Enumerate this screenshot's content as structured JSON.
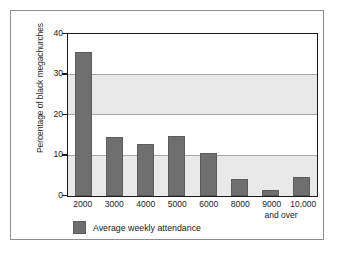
{
  "figure": {
    "border_color": "#8e8e8e",
    "background": "#ffffff"
  },
  "chart_data": {
    "type": "bar",
    "title": "",
    "xlabel": "",
    "ylabel": "Percentage of black megachurches",
    "categories": [
      "2000",
      "3000",
      "4000",
      "5000",
      "6000",
      "8000",
      "9000",
      "10,000"
    ],
    "category_sublabel": "and over",
    "values": [
      35.5,
      14.5,
      12.8,
      14.7,
      10.7,
      4.2,
      1.6,
      4.8
    ],
    "series": [
      {
        "name": "Average weekly attendance",
        "values": [
          35.5,
          14.5,
          12.8,
          14.7,
          10.7,
          4.2,
          1.6,
          4.8
        ],
        "color": "#6f6f6f"
      }
    ],
    "ylim": [
      0,
      40
    ],
    "yticks": [
      0,
      10,
      20,
      30,
      40
    ],
    "ytick_labels": [
      "0",
      "10",
      "20",
      "30",
      "40"
    ],
    "grid": true,
    "gridline_color": "#a8a8a8",
    "band_color": "#e9e9e9",
    "bands": [
      [
        0,
        10
      ],
      [
        20,
        30
      ]
    ],
    "legend": {
      "position": "bottom",
      "entries": [
        {
          "label": "Average weekly attendance",
          "color": "#6f6f6f"
        }
      ]
    },
    "axis_color": "#1a1a1a"
  }
}
